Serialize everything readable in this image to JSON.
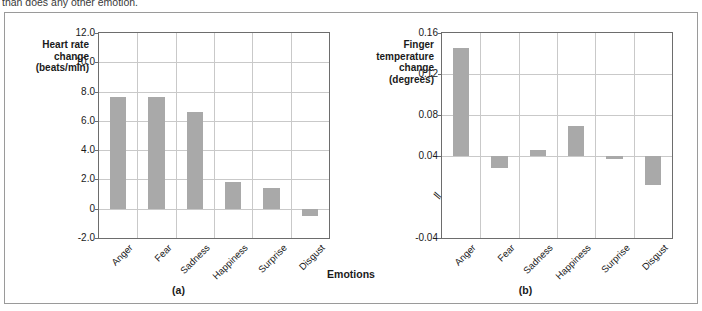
{
  "page": {
    "cutoff_text": "than does any other emotion."
  },
  "figure": {
    "shared_xlabel": "Emotions"
  },
  "chart_data": [
    {
      "type": "bar",
      "panel_label": "(a)",
      "title": "",
      "ylabel": "Heart rate change (beats/min)",
      "ylabel_lines": [
        "Heart rate",
        "change",
        "(beats/min)"
      ],
      "xlabel": "Emotions",
      "categories": [
        "Anger",
        "Fear",
        "Sadness",
        "Happiness",
        "Surprise",
        "Disgust"
      ],
      "values": [
        7.6,
        7.6,
        6.6,
        1.8,
        1.4,
        -0.5
      ],
      "ylim": [
        -2.0,
        12.0
      ],
      "yticks": [
        12.0,
        10.0,
        8.0,
        6.0,
        4.0,
        2.0,
        0,
        -2.0
      ],
      "ytick_labels": [
        "12.0",
        "10.0",
        "8.0",
        "6.0",
        "4.0",
        "2.0",
        "0",
        "-2.0"
      ],
      "grid": true,
      "legend": false,
      "bar_color": "#a9a9a9",
      "axis_break": false,
      "baseline": 0
    },
    {
      "type": "bar",
      "panel_label": "(b)",
      "title": "",
      "ylabel": "Finger temperature change (degrees)",
      "ylabel_lines": [
        "Finger",
        "temperature",
        "change",
        "(degrees)"
      ],
      "xlabel": "Emotions",
      "categories": [
        "Anger",
        "Fear",
        "Sadness",
        "Happiness",
        "Surprise",
        "Disgust"
      ],
      "values": [
        0.145,
        0.028,
        0.046,
        0.069,
        0.037,
        0.012
      ],
      "bar_bottoms": [
        0.04,
        0.04,
        0.04,
        0.04,
        0.04,
        0.04
      ],
      "bar_tops": [
        0.145,
        0.028,
        0.046,
        0.069,
        0.037,
        0.012
      ],
      "ylim": [
        -0.04,
        0.16
      ],
      "yticks": [
        0.16,
        0.12,
        0.08,
        0.04,
        -0.04
      ],
      "ytick_labels": [
        "0.16",
        "0.12",
        "0.08",
        "0.04",
        "-0.04"
      ],
      "grid": true,
      "legend": false,
      "bar_color": "#a9a9a9",
      "axis_break": true,
      "axis_break_symbol": "//",
      "baseline": 0.04
    }
  ]
}
